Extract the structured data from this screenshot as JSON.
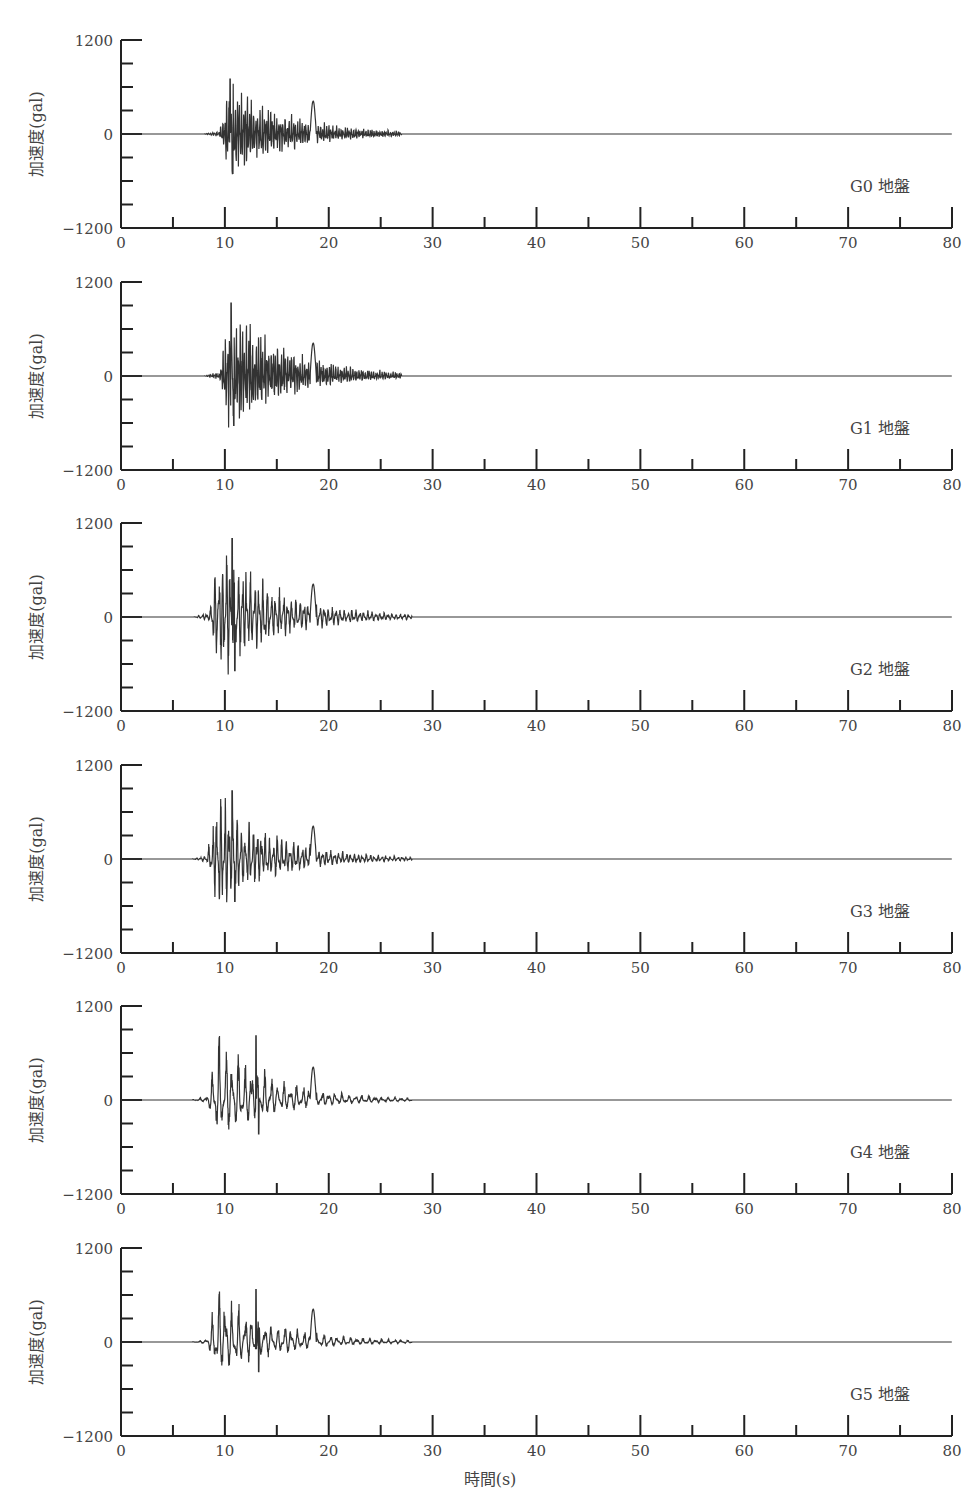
{
  "chart_data": {
    "type": "line",
    "title": "",
    "xlabel": "時間(s)",
    "ylabel": "加速度(gal)",
    "xlim": [
      0,
      80
    ],
    "ylim": [
      -1200,
      1200
    ],
    "x_ticks": [
      0,
      10,
      20,
      30,
      40,
      50,
      60,
      70,
      80
    ],
    "x_minor_ticks": [
      5,
      15,
      25,
      35,
      45,
      55,
      65,
      75
    ],
    "y_ticks": [
      -1200,
      0,
      1200
    ],
    "y_minor_ticks": [
      -900,
      -600,
      -300,
      300,
      600,
      900
    ],
    "grid": false,
    "panels": [
      {
        "name": "G0 地盤",
        "onset_s": 9.5,
        "end_s": 27,
        "peak_pos_gal": 700,
        "peak_neg_gal": -560,
        "peak_time_s": 10.5,
        "style": "high-frequency"
      },
      {
        "name": "G1 地盤",
        "onset_s": 9.5,
        "end_s": 27,
        "peak_pos_gal": 930,
        "peak_neg_gal": -700,
        "peak_time_s": 10.6,
        "style": "high-frequency"
      },
      {
        "name": "G2 地盤",
        "onset_s": 8.5,
        "end_s": 28,
        "peak_pos_gal": 1000,
        "peak_neg_gal": -760,
        "peak_time_s": 10.7,
        "style": "mid-frequency"
      },
      {
        "name": "G3 地盤",
        "onset_s": 8.3,
        "end_s": 28,
        "peak_pos_gal": 870,
        "peak_neg_gal": -600,
        "peak_time_s": 10.7,
        "style": "mid-frequency"
      },
      {
        "name": "G4 地盤",
        "onset_s": 8.3,
        "end_s": 28,
        "peak_pos_gal": 820,
        "peak_neg_gal": -480,
        "peak_time_s": 13.0,
        "style": "low-frequency"
      },
      {
        "name": "G5 地盤",
        "onset_s": 8.3,
        "end_s": 28,
        "peak_pos_gal": 670,
        "peak_neg_gal": -420,
        "peak_time_s": 13.0,
        "style": "low-frequency"
      }
    ]
  },
  "axis": {
    "y_top_label": "1200",
    "y_zero_label": "0",
    "y_bottom_label": "−1200",
    "x_labels": [
      "0",
      "10",
      "20",
      "30",
      "40",
      "50",
      "60",
      "70",
      "80"
    ]
  }
}
